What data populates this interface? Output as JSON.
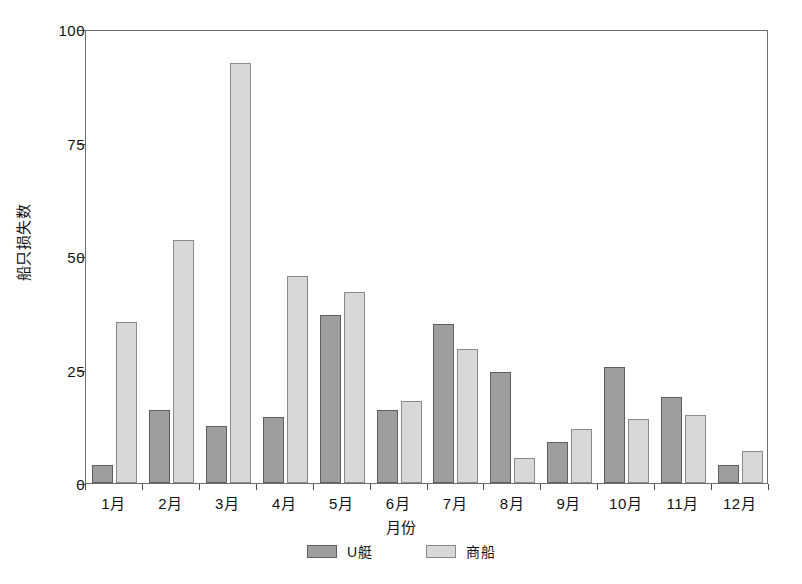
{
  "chart_data": {
    "type": "bar",
    "title": "",
    "xlabel": "月份",
    "ylabel": "船只损失数",
    "categories": [
      "1月",
      "2月",
      "3月",
      "4月",
      "5月",
      "6月",
      "7月",
      "8月",
      "9月",
      "10月",
      "11月",
      "12月"
    ],
    "series": [
      {
        "name": "U艇",
        "color": "#9e9e9e",
        "values": [
          4,
          16,
          12.5,
          14.5,
          37,
          16,
          35,
          24.5,
          9,
          25.5,
          19,
          4
        ]
      },
      {
        "name": "商船",
        "color": "#d8d8d8",
        "values": [
          35.5,
          53.5,
          92.5,
          45.5,
          42,
          18,
          29.5,
          5.5,
          12,
          14,
          15,
          7
        ]
      }
    ],
    "ylim": [
      0,
      100
    ],
    "y_ticks": [
      0,
      25,
      50,
      75,
      100
    ],
    "y_tick_labels": [
      "0",
      "25",
      "50",
      "75",
      "100"
    ],
    "grid": false,
    "legend_position": "bottom"
  },
  "axis": {
    "y_title": "船只损失数",
    "x_title": "月份"
  },
  "legend": {
    "items": [
      {
        "label": "U艇",
        "color": "#9e9e9e"
      },
      {
        "label": "商船",
        "color": "#d8d8d8"
      }
    ]
  }
}
